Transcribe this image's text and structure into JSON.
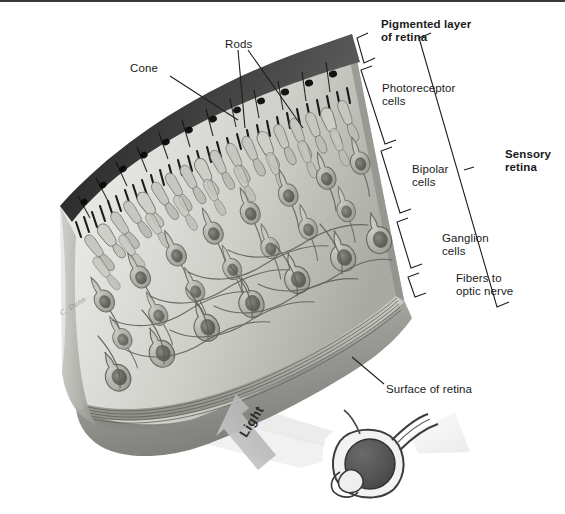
{
  "figure": {
    "artist_signature": "C. Dunn",
    "border_color": "#3a3a3a",
    "background": "#ffffff",
    "width": 565,
    "height": 514
  },
  "labels": {
    "cone": "Cone",
    "rods": "Rods",
    "pigmented_layer_line1": "Pigmented layer",
    "pigmented_layer_line2": "of retina",
    "photoreceptor_line1": "Photoreceptor",
    "photoreceptor_line2": "cells",
    "bipolar_line1": "Bipolar",
    "bipolar_line2": "cells",
    "ganglion_line1": "Ganglion",
    "ganglion_line2": "cells",
    "fibers_line1": "Fibers to",
    "fibers_line2": "optic nerve",
    "sensory_line1": "Sensory",
    "sensory_line2": "retina",
    "surface_of_retina": "Surface of retina",
    "light": "Light"
  },
  "colors": {
    "ink": "#1a1a1a",
    "leader_line": "#1f1f1f",
    "pigment_epithelium_dark": "#2b2b2b",
    "pigment_epithelium_mid": "#4a4a4a",
    "tissue_light": "#dcdcd8",
    "tissue_mid": "#c2c2bd",
    "tissue_shadow": "#9d9d98",
    "cell_body": "#a8a8a2",
    "cell_nucleus": "#6e6e68",
    "nerve_fiber_band": "#b5b5b0",
    "light_beam": "#ececec",
    "eye_vitreous": "#575757",
    "eye_outline": "#3c3c3c",
    "signature": "#8c8c8c"
  },
  "structures": {
    "tissue_block": "wedge-shaped slab of retina seen in three-quarter perspective, curving from upper-left to lower-right",
    "pigmented_epithelium": "row of dark cuboidal cells with nuclei along the top edge, bearing comb-like microvilli",
    "photoreceptor_layer": "rod and cone outer segments interdigitating with the pigment epithelium",
    "bipolar_layer": "spindle-shaped bipolar neurons in the middle of the slab",
    "ganglion_layer": "large round-bodied ganglion neurons near the inner surface",
    "nerve_fiber_layer": "parallel striated band of axons at the lower cut edge",
    "inner_surface": "smooth pale inner face of the retina facing the vitreous",
    "light_cone": "pale wedge of light entering from lower right toward the retina",
    "eye_inset": "small sagittal eyeball with dark vitreous, lens, and optic nerve"
  },
  "brackets": [
    {
      "name": "pigmented-layer-bracket",
      "target": "pigmented_layer"
    },
    {
      "name": "photoreceptor-bracket",
      "target": "photoreceptor_cells"
    },
    {
      "name": "bipolar-bracket",
      "target": "bipolar_cells"
    },
    {
      "name": "ganglion-bracket",
      "target": "ganglion_cells"
    },
    {
      "name": "fibers-bracket",
      "target": "fibers_to_optic_nerve"
    },
    {
      "name": "sensory-retina-bracket",
      "target": "sensory_retina"
    }
  ],
  "leaders": [
    {
      "name": "cone-leader",
      "from": "Cone",
      "to": "a cone outer segment"
    },
    {
      "name": "rods-leader-left",
      "from": "Rods",
      "to": "a rod outer segment"
    },
    {
      "name": "rods-leader-right",
      "from": "Rods",
      "to": "a second rod outer segment"
    },
    {
      "name": "surface-leader",
      "from": "Surface of retina",
      "to": "inner retinal surface"
    }
  ]
}
